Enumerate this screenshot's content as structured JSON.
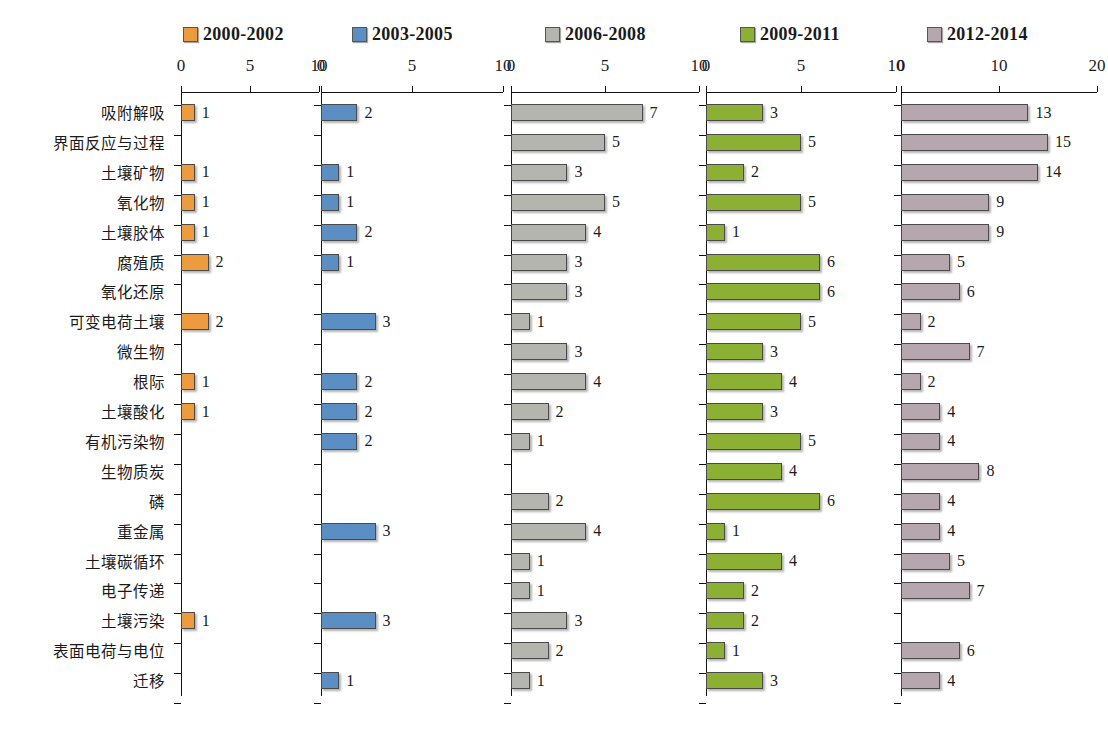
{
  "chart_data": {
    "type": "bar",
    "orientation": "horizontal",
    "title": "",
    "xlabel": "",
    "ylabel": "",
    "grid": false,
    "legend_position": "top",
    "categories": [
      "吸附解吸",
      "界面反应与过程",
      "土壤矿物",
      "氧化物",
      "土壤胶体",
      "腐殖质",
      "氧化还原",
      "可变电荷土壤",
      "微生物",
      "根际",
      "土壤酸化",
      "有机污染物",
      "生物质炭",
      "磷",
      "重金属",
      "土壤碳循环",
      "电子传递",
      "土壤污染",
      "表面电荷与电位",
      "迁移"
    ],
    "panels": [
      {
        "name": "2000-2002",
        "color": "#ED9B3F",
        "xlim": [
          0,
          10
        ],
        "xticks": [
          0,
          5,
          10
        ],
        "xtick_labels": [
          "0",
          "5",
          "10"
        ],
        "values": [
          1,
          null,
          1,
          1,
          1,
          2,
          null,
          2,
          null,
          1,
          1,
          null,
          null,
          null,
          null,
          null,
          null,
          1,
          null,
          null
        ]
      },
      {
        "name": "2003-2005",
        "color": "#5B8FC4",
        "xlim": [
          0,
          10
        ],
        "xticks": [
          0,
          5,
          10
        ],
        "xtick_labels": [
          "0",
          "5",
          "10"
        ],
        "values": [
          2,
          null,
          1,
          1,
          2,
          1,
          null,
          3,
          null,
          2,
          2,
          2,
          null,
          null,
          3,
          null,
          null,
          3,
          null,
          1
        ]
      },
      {
        "name": "2006-2008",
        "color": "#B5B5B0",
        "xlim": [
          0,
          10
        ],
        "xticks": [
          0,
          5,
          10
        ],
        "xtick_labels": [
          "0",
          "5",
          "10"
        ],
        "values": [
          7,
          5,
          3,
          5,
          4,
          3,
          3,
          1,
          3,
          4,
          2,
          1,
          null,
          2,
          4,
          1,
          1,
          3,
          2,
          1
        ]
      },
      {
        "name": "2009-2011",
        "color": "#8CB033",
        "xlim": [
          0,
          10
        ],
        "xticks": [
          0,
          5,
          10
        ],
        "xtick_labels": [
          "0",
          "5",
          "10"
        ],
        "values": [
          3,
          5,
          2,
          5,
          1,
          6,
          6,
          5,
          3,
          4,
          3,
          5,
          4,
          6,
          1,
          4,
          2,
          2,
          1,
          3
        ]
      },
      {
        "name": "2012-2014",
        "color": "#B6A7AE",
        "xlim": [
          0,
          20
        ],
        "xticks": [
          0,
          10,
          20
        ],
        "xtick_labels": [
          "0",
          "10",
          "20"
        ],
        "values": [
          13,
          15,
          14,
          9,
          9,
          5,
          6,
          2,
          7,
          2,
          4,
          4,
          8,
          4,
          4,
          5,
          7,
          null,
          6,
          4
        ]
      }
    ]
  }
}
